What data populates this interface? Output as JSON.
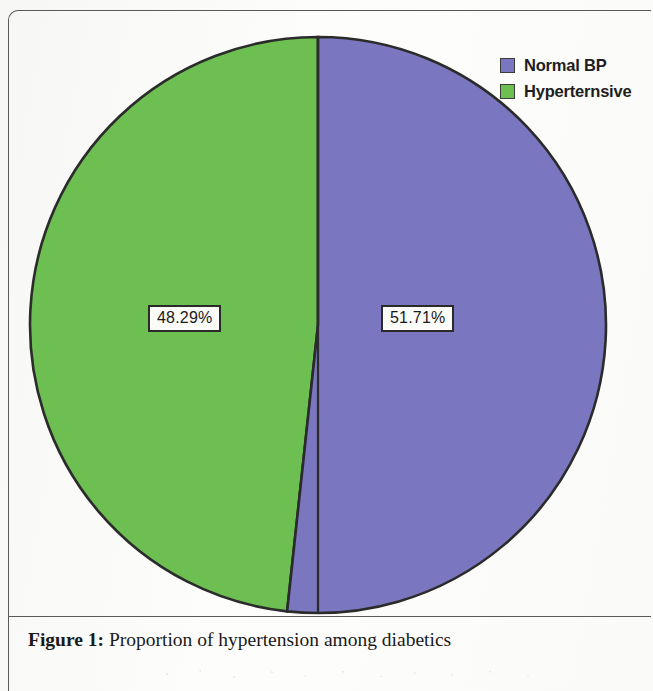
{
  "figure": {
    "caption_label": "Figure 1:",
    "caption_text": " Proportion of hypertension among diabetics"
  },
  "legend": {
    "items": [
      {
        "label": "Normal BP",
        "color": "#7a76bf"
      },
      {
        "label": "Hyperternsive",
        "color": "#6cbf50"
      }
    ]
  },
  "labels": {
    "hypertensive": "48.29%",
    "normal": "51.71%"
  },
  "chart_data": {
    "type": "pie",
    "title": "Proportion of hypertension among diabetics",
    "categories": [
      "Normal BP",
      "Hyperternsive"
    ],
    "values": [
      51.71,
      48.29
    ],
    "value_labels": [
      "51.71%",
      "48.29%"
    ],
    "colors": [
      "#7a76bf",
      "#6cbf50"
    ],
    "units": "percent",
    "total": 100,
    "legend_position": "top-right",
    "start_angle_deg": 0,
    "direction": "clockwise",
    "grid": false,
    "series": [
      {
        "name": "Proportion",
        "slices": [
          {
            "name": "Normal BP",
            "value": 51.71,
            "label": "51.71%",
            "color": "#7a76bf"
          },
          {
            "name": "Hyperternsive",
            "value": 48.29,
            "label": "48.29%",
            "color": "#6cbf50"
          }
        ]
      }
    ]
  }
}
